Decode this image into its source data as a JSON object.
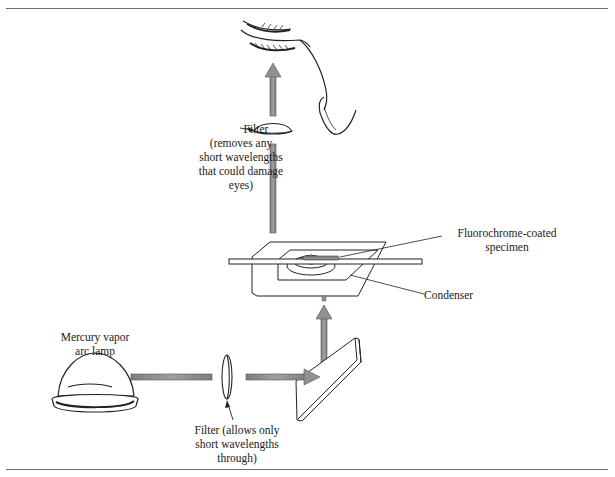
{
  "figure": {
    "type": "fluorescence microscope light path diagram",
    "colors": {
      "beam": "#8c8c8c",
      "beam_edge": "#555555",
      "line": "#222222",
      "rule": "#6e6e6e"
    },
    "labels": {
      "barrier_filter": {
        "line1": "Filter",
        "line2": "(removes any",
        "line3": "short wavelengths",
        "line4": "that could damage",
        "line5": "eyes)"
      },
      "specimen": {
        "line1": "Fluorochrome-coated",
        "line2": "specimen"
      },
      "condenser": "Condenser",
      "lamp": {
        "line1": "Mercury vapor",
        "line2": "arc lamp"
      },
      "exciter_filter": {
        "line1": "Filter (allows only",
        "line2": "short wavelengths",
        "line3": "through)"
      }
    },
    "components": [
      "eye-icon",
      "barrier-filter-lens",
      "microscope-stage",
      "specimen-slide",
      "condenser",
      "mirror",
      "exciter-filter-lens",
      "mercury-vapor-lamp"
    ]
  }
}
